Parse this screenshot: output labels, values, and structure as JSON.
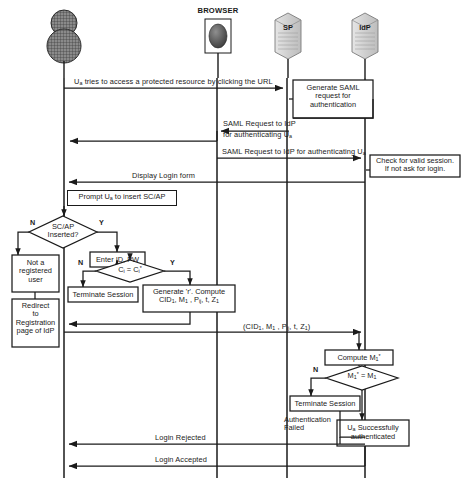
{
  "figure": {
    "type": "uml-sequence-diagram"
  },
  "actors": [
    {
      "id": "user",
      "name": "",
      "icon": "user-person-icon",
      "lifeline_x": 64,
      "label_visible": false
    },
    {
      "id": "browser",
      "name": "BROWSER",
      "icon": "browser-globe-icon",
      "lifeline_x": 217,
      "label_visible": true
    },
    {
      "id": "sp",
      "name": "SP",
      "icon": "server-database-icon",
      "lifeline_x": 287,
      "label_visible": true
    },
    {
      "id": "idp",
      "name": "IdP",
      "icon": "server-database-icon",
      "lifeline_x": 365,
      "label_visible": true
    }
  ],
  "messages": [
    {
      "id": "m1",
      "text": "U",
      "sub": "a",
      "rest": " tries to access a protected resource by clicking the URL",
      "from": "user",
      "to": "sp",
      "y": 78
    },
    {
      "id": "m2",
      "line1": "SAML  Request to IdP",
      "line2": "for authenticating U",
      "sub2": "a",
      "from": "sp",
      "to": "browser",
      "y": 120
    },
    {
      "id": "m3",
      "text": "SAML  Request to IdP for authenticating U",
      "sub": "a",
      "from": "browser",
      "to": "idp",
      "y": 146
    },
    {
      "id": "m4",
      "text": "Display Login form",
      "from": "idp",
      "to": "user",
      "y": 172
    },
    {
      "id": "m5",
      "text": "(CID",
      "sub": "1",
      "rest": ", M",
      "sub2": "1",
      "rest2": ", P",
      "sub3": "ij",
      "rest3": ", t, Z",
      "sub4": "1",
      "rest4": ")",
      "from": "user",
      "to": "idp",
      "y": 324
    },
    {
      "id": "m6",
      "text": "Login Rejected",
      "from": "idp",
      "to": "user",
      "y": 444
    },
    {
      "id": "m7",
      "text": "Login Accepted",
      "from": "idp",
      "to": "user",
      "y": 466
    }
  ],
  "activity_boxes": [
    {
      "id": "gen-saml",
      "lines": [
        "Generate SAML",
        "request for",
        "authentication"
      ],
      "x": 293,
      "y": 80,
      "w": 80,
      "h": 38
    },
    {
      "id": "check-session",
      "lines": [
        "Check for valid session.",
        "If not ask for login."
      ],
      "x": 370,
      "y": 155,
      "w": 90,
      "h": 22
    },
    {
      "id": "prompt-scap",
      "lines": [
        "Prompt U",
        "a",
        " to insert SC/AP"
      ],
      "text": "Prompt Ua to insert SC/AP",
      "x": 67,
      "y": 190,
      "w": 110,
      "h": 16
    },
    {
      "id": "not-registered",
      "lines": [
        "Not a",
        "registered",
        "user"
      ],
      "x": 12,
      "y": 255,
      "w": 47,
      "h": 37
    },
    {
      "id": "redirect-idp",
      "lines": [
        "Redirect",
        "to",
        "Registration",
        "page of IdP"
      ],
      "x": 12,
      "y": 299,
      "w": 47,
      "h": 48
    },
    {
      "id": "enter-idpw",
      "lines": [
        "Enter ID, PW"
      ],
      "x": 90,
      "y": 252,
      "w": 55,
      "h": 15
    },
    {
      "id": "terminate-session-left",
      "lines": [
        "Terminate Session"
      ],
      "x": 68,
      "y": 287,
      "w": 70,
      "h": 15
    },
    {
      "id": "generate-r-compute",
      "lines": [
        "Generate  'r'. Compute",
        "CID1, M1, Pij, t, Z1"
      ],
      "x": 143,
      "y": 285,
      "w": 92,
      "h": 27
    },
    {
      "id": "compute-m1star",
      "lines": [
        "Compute M1*"
      ],
      "x": 325,
      "y": 350,
      "w": 68,
      "h": 15
    },
    {
      "id": "terminate-session-right",
      "lines": [
        "Terminate Session"
      ],
      "x": 290,
      "y": 396,
      "w": 70,
      "h": 15
    },
    {
      "id": "ua-success",
      "lines": [
        "U",
        "a",
        " Successfully",
        "authenticated"
      ],
      "x": 337,
      "y": 420,
      "w": 72,
      "h": 26
    }
  ],
  "decisions": [
    {
      "id": "scap-inserted",
      "lines": [
        "SC/AP",
        "Inserted?"
      ],
      "cx": 63,
      "cy": 232,
      "rx": 34,
      "ry": 16,
      "no_label": "N",
      "yes_label": "Y"
    },
    {
      "id": "ci-equals-cistar",
      "text": "Ci = Ci*",
      "cx": 130,
      "cy": 271,
      "rx": 34,
      "ry": 11,
      "no_label": "N",
      "yes_label": "Y"
    },
    {
      "id": "m1star-equals-m1",
      "text": "M1* = M1",
      "cx": 362,
      "cy": 378,
      "rx": 36,
      "ry": 12,
      "no_label": "N",
      "yes_label": ""
    }
  ],
  "annotations": [
    {
      "id": "auth-failed",
      "lines": [
        "Authentication",
        "Failed"
      ],
      "x": 286,
      "y": 416
    }
  ],
  "colors": {
    "stroke": "#1a1a1a",
    "background": "#ffffff",
    "icon_fill": "#6e6e6e",
    "server_fill": "#d8d8d8"
  }
}
